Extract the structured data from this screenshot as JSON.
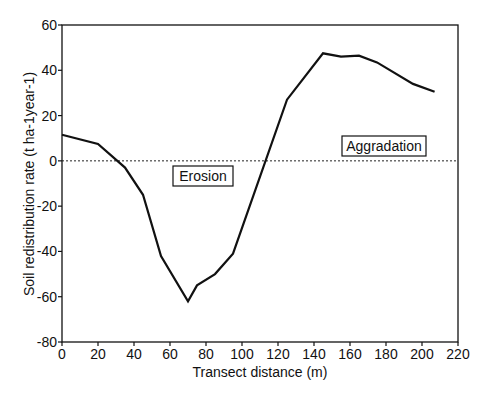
{
  "chart_data": {
    "type": "line",
    "title": "",
    "xlabel": "Transect distance (m)",
    "ylabel": "Soil redistribution rate (t ha-1year-1)",
    "xlim": [
      0,
      220
    ],
    "ylim": [
      -80,
      60
    ],
    "xticks": [
      0,
      20,
      40,
      60,
      80,
      100,
      120,
      140,
      160,
      180,
      200,
      220
    ],
    "yticks": [
      -80,
      -60,
      -40,
      -20,
      0,
      20,
      40,
      60
    ],
    "grid": false,
    "legend": null,
    "reference_line": {
      "y": 0,
      "style": "dotted"
    },
    "annotations": [
      {
        "text": "Erosion",
        "x": 72,
        "y": -8,
        "boxed": true
      },
      {
        "text": "Aggradation",
        "x": 165,
        "y": 5,
        "boxed": true
      }
    ],
    "series": [
      {
        "name": "Soil redistribution rate",
        "x": [
          0,
          20,
          35,
          45,
          55,
          70,
          75,
          85,
          95,
          125,
          145,
          155,
          165,
          175,
          195,
          207
        ],
        "y": [
          11.5,
          7.5,
          -3,
          -15,
          -42,
          -62,
          -55,
          -50,
          -41,
          27,
          47.5,
          46,
          46.5,
          43.5,
          34,
          30.5
        ]
      }
    ]
  },
  "labels": {
    "xlabel": "Transect distance (m)",
    "ylabel": "Soil redistribution rate (t ha-1year-1)",
    "erosion": "Erosion",
    "aggradation": "Aggradation"
  },
  "colors": {
    "line": "#111111",
    "axis": "#111111",
    "reference": "#222222"
  }
}
